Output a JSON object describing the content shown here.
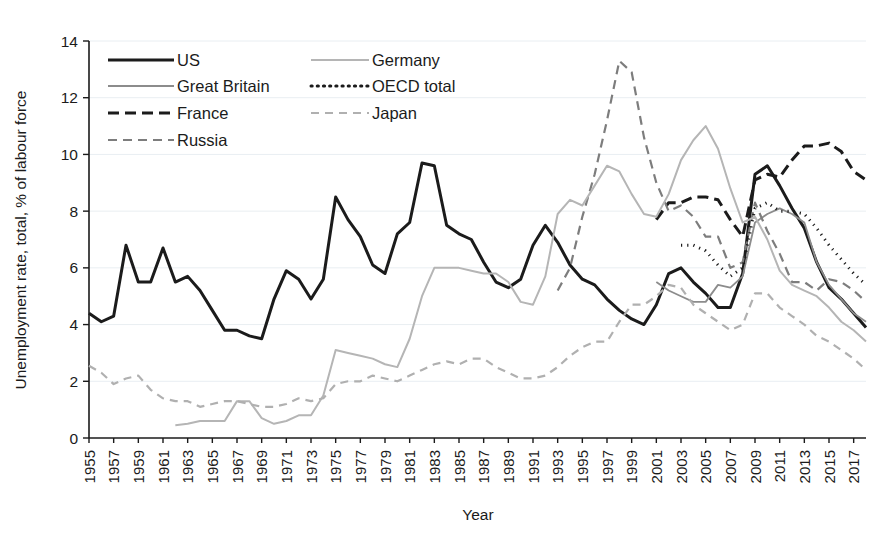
{
  "chart_data": {
    "type": "line",
    "title": "",
    "xlabel": "Year",
    "ylabel": "Unemployment rate, total, % of labour force",
    "xlim": [
      1955,
      2018
    ],
    "ylim": [
      0,
      14
    ],
    "ytick_values": [
      0,
      2,
      4,
      6,
      8,
      10,
      12,
      14
    ],
    "ytick_labels": [
      "0",
      "2",
      "4",
      "6",
      "8",
      "10",
      "12",
      "14"
    ],
    "xtick_labels": [
      "1955",
      "1957",
      "1959",
      "1961",
      "1963",
      "1965",
      "1967",
      "1969",
      "1971",
      "1973",
      "1975",
      "1977",
      "1979",
      "1981",
      "1983",
      "1985",
      "1987",
      "1989",
      "1991",
      "1993",
      "1995",
      "1997",
      "1999",
      "2001",
      "2003",
      "2005",
      "2007",
      "2009",
      "2011",
      "2013",
      "2015",
      "2017"
    ],
    "grid": "horizontal-faint",
    "legend_position": "top-left-inside",
    "series": [
      {
        "name": "US",
        "style": "solid",
        "color": "#1b1b1b",
        "width": 3.0,
        "dash": "",
        "x": [
          1955,
          1956,
          1957,
          1958,
          1959,
          1960,
          1961,
          1962,
          1963,
          1964,
          1965,
          1966,
          1967,
          1968,
          1969,
          1970,
          1971,
          1972,
          1973,
          1974,
          1975,
          1976,
          1977,
          1978,
          1979,
          1980,
          1981,
          1982,
          1983,
          1984,
          1985,
          1986,
          1987,
          1988,
          1989,
          1990,
          1991,
          1992,
          1993,
          1994,
          1995,
          1996,
          1997,
          1998,
          1999,
          2000,
          2001,
          2002,
          2003,
          2004,
          2005,
          2006,
          2007,
          2008,
          2009,
          2010,
          2011,
          2012,
          2013,
          2014,
          2015,
          2016,
          2017,
          2018
        ],
        "y": [
          4.4,
          4.1,
          4.3,
          6.8,
          5.5,
          5.5,
          6.7,
          5.5,
          5.7,
          5.2,
          4.5,
          3.8,
          3.8,
          3.6,
          3.5,
          4.9,
          5.9,
          5.6,
          4.9,
          5.6,
          8.5,
          7.7,
          7.1,
          6.1,
          5.8,
          7.2,
          7.6,
          9.7,
          9.6,
          7.5,
          7.2,
          7.0,
          6.2,
          5.5,
          5.3,
          5.6,
          6.8,
          7.5,
          6.9,
          6.1,
          5.6,
          5.4,
          4.9,
          4.5,
          4.2,
          4.0,
          4.7,
          5.8,
          6.0,
          5.5,
          5.1,
          4.6,
          4.6,
          5.8,
          9.3,
          9.6,
          8.9,
          8.1,
          7.4,
          6.2,
          5.3,
          4.9,
          4.4,
          3.9
        ]
      },
      {
        "name": "Great Britain",
        "style": "solid",
        "color": "#8c8c8c",
        "width": 1.8,
        "dash": "",
        "x": [
          2001,
          2002,
          2003,
          2004,
          2005,
          2006,
          2007,
          2008,
          2009,
          2010,
          2011,
          2012,
          2013,
          2014,
          2015,
          2016,
          2017,
          2018
        ],
        "y": [
          5.5,
          5.2,
          5.0,
          4.8,
          4.8,
          5.4,
          5.3,
          5.7,
          7.6,
          7.9,
          8.1,
          7.9,
          7.6,
          6.2,
          5.4,
          4.9,
          4.4,
          4.1
        ]
      },
      {
        "name": "France",
        "style": "dashed",
        "color": "#1b1b1b",
        "width": 3.0,
        "dash": "11,6",
        "x": [
          2001,
          2002,
          2003,
          2004,
          2005,
          2006,
          2007,
          2008,
          2009,
          2010,
          2011,
          2012,
          2013,
          2014,
          2015,
          2016,
          2017,
          2018
        ],
        "y": [
          7.7,
          8.3,
          8.3,
          8.5,
          8.5,
          8.4,
          7.7,
          7.1,
          9.1,
          9.3,
          9.2,
          9.8,
          10.3,
          10.3,
          10.4,
          10.1,
          9.4,
          9.1
        ]
      },
      {
        "name": "Russia",
        "style": "dashed",
        "color": "#7d7d7d",
        "width": 2.2,
        "dash": "9,6",
        "x": [
          1993,
          1994,
          1995,
          1996,
          1997,
          1998,
          1999,
          2000,
          2001,
          2002,
          2003,
          2004,
          2005,
          2006,
          2007,
          2008,
          2009,
          2010,
          2011,
          2012,
          2013,
          2014,
          2015,
          2016,
          2017,
          2018
        ],
        "y": [
          5.2,
          6.0,
          7.8,
          9.3,
          11.2,
          13.3,
          12.9,
          10.6,
          9.0,
          8.0,
          8.2,
          7.8,
          7.1,
          7.1,
          6.0,
          6.2,
          8.3,
          7.3,
          6.5,
          5.5,
          5.5,
          5.2,
          5.6,
          5.5,
          5.2,
          4.8
        ]
      },
      {
        "name": "Germany",
        "style": "solid",
        "color": "#b5b5b5",
        "width": 2.0,
        "dash": "",
        "x": [
          1962,
          1963,
          1964,
          1965,
          1966,
          1967,
          1968,
          1969,
          1970,
          1971,
          1972,
          1973,
          1974,
          1975,
          1976,
          1977,
          1978,
          1979,
          1980,
          1981,
          1982,
          1983,
          1984,
          1985,
          1986,
          1987,
          1988,
          1989,
          1990,
          1991,
          1992,
          1993,
          1994,
          1995,
          1996,
          1997,
          1998,
          1999,
          2000,
          2001,
          2002,
          2003,
          2004,
          2005,
          2006,
          2007,
          2008,
          2009,
          2010,
          2011,
          2012,
          2013,
          2014,
          2015,
          2016,
          2017,
          2018
        ],
        "y": [
          0.45,
          0.5,
          0.6,
          0.6,
          0.6,
          1.3,
          1.3,
          0.7,
          0.5,
          0.6,
          0.8,
          0.8,
          1.5,
          3.1,
          3.0,
          2.9,
          2.8,
          2.6,
          2.5,
          3.5,
          5.0,
          6.0,
          6.0,
          6.0,
          5.9,
          5.8,
          5.8,
          5.5,
          4.8,
          4.7,
          5.7,
          7.9,
          8.4,
          8.2,
          8.9,
          9.6,
          9.4,
          8.6,
          7.9,
          7.8,
          8.6,
          9.8,
          10.5,
          11.0,
          10.2,
          8.8,
          7.6,
          7.8,
          7.0,
          5.9,
          5.4,
          5.2,
          5.0,
          4.6,
          4.1,
          3.8,
          3.4
        ]
      },
      {
        "name": "OECD total",
        "style": "dotted",
        "color": "#1b1b1b",
        "width": 3.0,
        "dash": "1.2,5",
        "x": [
          2003,
          2004,
          2005,
          2006,
          2007,
          2008,
          2009,
          2010,
          2011,
          2012,
          2013,
          2014,
          2015,
          2016,
          2017,
          2018
        ],
        "y": [
          6.8,
          6.8,
          6.6,
          6.1,
          5.7,
          6.0,
          8.1,
          8.3,
          8.0,
          8.0,
          7.9,
          7.4,
          6.8,
          6.3,
          5.8,
          5.4
        ]
      },
      {
        "name": "Japan",
        "style": "dashed",
        "color": "#b0b0b0",
        "width": 2.2,
        "dash": "8,6",
        "x": [
          1955,
          1956,
          1957,
          1958,
          1959,
          1960,
          1961,
          1962,
          1963,
          1964,
          1965,
          1966,
          1967,
          1968,
          1969,
          1970,
          1971,
          1972,
          1973,
          1974,
          1975,
          1976,
          1977,
          1978,
          1979,
          1980,
          1981,
          1982,
          1983,
          1984,
          1985,
          1986,
          1987,
          1988,
          1989,
          1990,
          1991,
          1992,
          1993,
          1994,
          1995,
          1996,
          1997,
          1998,
          1999,
          2000,
          2001,
          2002,
          2003,
          2004,
          2005,
          2006,
          2007,
          2008,
          2009,
          2010,
          2011,
          2012,
          2013,
          2014,
          2015,
          2016,
          2017,
          2018
        ],
        "y": [
          2.55,
          2.3,
          1.9,
          2.1,
          2.2,
          1.7,
          1.4,
          1.3,
          1.3,
          1.1,
          1.2,
          1.3,
          1.3,
          1.2,
          1.1,
          1.1,
          1.2,
          1.4,
          1.3,
          1.4,
          1.9,
          2.0,
          2.0,
          2.2,
          2.1,
          2.0,
          2.2,
          2.4,
          2.6,
          2.7,
          2.6,
          2.8,
          2.8,
          2.5,
          2.3,
          2.1,
          2.1,
          2.2,
          2.5,
          2.9,
          3.2,
          3.4,
          3.4,
          4.1,
          4.7,
          4.7,
          5.0,
          5.4,
          5.3,
          4.7,
          4.4,
          4.1,
          3.8,
          4.0,
          5.1,
          5.1,
          4.6,
          4.3,
          4.0,
          3.6,
          3.4,
          3.1,
          2.8,
          2.4
        ]
      }
    ],
    "legend_entries": [
      {
        "label": "US",
        "style": "solid",
        "color": "#1b1b1b",
        "width": 3.0,
        "dash": ""
      },
      {
        "label": "Great Britain",
        "style": "solid",
        "color": "#8c8c8c",
        "width": 1.8,
        "dash": ""
      },
      {
        "label": "France",
        "style": "dashed",
        "color": "#1b1b1b",
        "width": 3.0,
        "dash": "11,6"
      },
      {
        "label": "Russia",
        "style": "dashed",
        "color": "#7d7d7d",
        "width": 2.2,
        "dash": "9,6"
      },
      {
        "label": "Germany",
        "style": "solid",
        "color": "#b5b5b5",
        "width": 2.0,
        "dash": ""
      },
      {
        "label": "OECD total",
        "style": "dotted",
        "color": "#1b1b1b",
        "width": 3.0,
        "dash": "1.2,5"
      },
      {
        "label": "Japan",
        "style": "dashed",
        "color": "#b0b0b0",
        "width": 2.2,
        "dash": "8,6"
      }
    ]
  }
}
